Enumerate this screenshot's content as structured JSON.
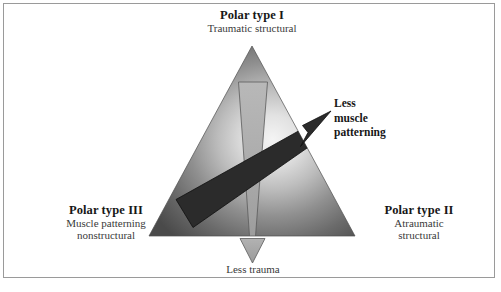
{
  "figure": {
    "type": "triangle-polar-classification-diagram",
    "background_color": "#ffffff",
    "frame_color": "#9a9a9a"
  },
  "vertices": {
    "top": {
      "title": "Polar type I",
      "subtitle": "Traumatic structural"
    },
    "bottom_left": {
      "title": "Polar type III",
      "subtitle_line1": "Muscle patterning",
      "subtitle_line2": "nonstructural"
    },
    "bottom_right": {
      "title": "Polar type II",
      "subtitle_line1": "Atraumatic",
      "subtitle_line2": "structural"
    }
  },
  "arrows": {
    "muscle_patterning": {
      "label_line1": "Less",
      "label_line2": "muscle",
      "label_line3": "patterning",
      "color": "#2e2e2e",
      "direction": "up-right"
    },
    "trauma": {
      "label": "Less trauma",
      "color": "#a6a6a6",
      "direction": "down"
    }
  },
  "colors": {
    "triangle_edge": "#4a4a4a",
    "triangle_center": "#f2f2f2",
    "dark_arrow": "#2e2e2e",
    "light_arrow": "#a8a8a8",
    "text_primary": "#171717",
    "text_secondary": "#3a3a3a"
  }
}
